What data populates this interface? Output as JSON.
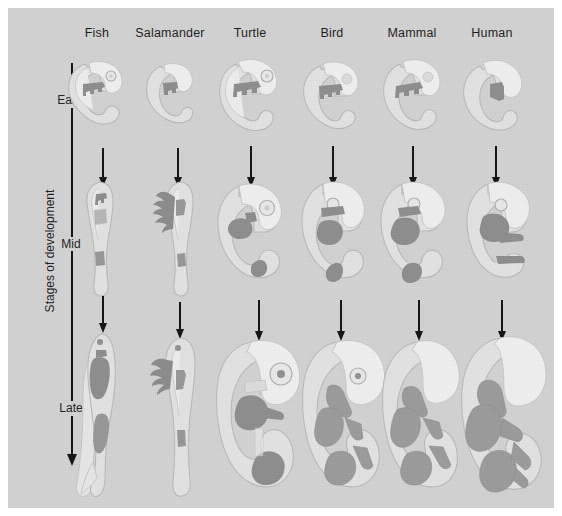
{
  "figure": {
    "background_color": "#d2d2d2",
    "frame_color": "#ffffff",
    "axis": {
      "title": "Stages of development",
      "direction": "downward-arrow",
      "labels": [
        {
          "text": "Early",
          "stage": "early"
        },
        {
          "text": "Mid",
          "stage": "mid"
        },
        {
          "text": "Late",
          "stage": "late"
        }
      ]
    },
    "columns": [
      {
        "label": "Fish",
        "key": "fish"
      },
      {
        "label": "Salamander",
        "key": "salamander"
      },
      {
        "label": "Turtle",
        "key": "turtle"
      },
      {
        "label": "Bird",
        "key": "bird"
      },
      {
        "label": "Mammal",
        "key": "mammal"
      },
      {
        "label": "Human",
        "key": "human"
      }
    ],
    "rows": [
      {
        "stage": "early",
        "label": "Early"
      },
      {
        "stage": "mid",
        "label": "Mid"
      },
      {
        "stage": "late",
        "label": "Late"
      }
    ],
    "colors": {
      "body_fill": "#e2e2e2",
      "body_stroke": "#b9b9b9",
      "highlight_dark": "#8c8c8c",
      "highlight_mid": "#b6b6b6",
      "arrow": "#111111",
      "text": "#1b1b1b"
    }
  }
}
